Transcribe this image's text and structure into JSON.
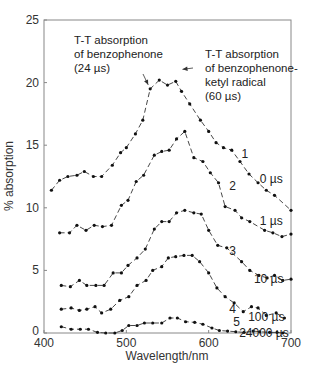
{
  "chart_data": {
    "type": "line",
    "title": "",
    "xlabel": "Wavelength/nm",
    "ylabel": "% absorption",
    "xlim": [
      400,
      700
    ],
    "ylim": [
      0,
      25
    ],
    "xticks": [
      400,
      500,
      600,
      700
    ],
    "yticks": [
      0,
      5,
      10,
      15,
      20,
      25
    ],
    "grid": false,
    "legend": "none (inline series labels)",
    "series": [
      {
        "name": "1",
        "time_label": "0 µs",
        "x": [
          409,
          419,
          429,
          440,
          449,
          460,
          470,
          483,
          493,
          500,
          511,
          520,
          529,
          540,
          550,
          560,
          567,
          577,
          590,
          600,
          609,
          618,
          628,
          638,
          649,
          660,
          670,
          680,
          700
        ],
        "y": [
          11.4,
          12.2,
          12.5,
          12.6,
          12.9,
          12.5,
          12.5,
          13.4,
          14.4,
          14.8,
          15.9,
          17.0,
          19.5,
          20.2,
          19.8,
          20.1,
          19.3,
          18.3,
          17.0,
          16.1,
          15.2,
          14.8,
          14.6,
          13.7,
          12.7,
          12.0,
          11.4,
          11.0,
          9.8
        ]
      },
      {
        "name": "2",
        "time_label": "1 µs",
        "x": [
          419,
          431,
          440,
          451,
          461,
          471,
          482,
          494,
          502,
          512,
          521,
          534,
          543,
          552,
          561,
          571,
          582,
          593,
          602,
          612,
          620,
          632,
          640,
          650,
          668,
          678,
          689,
          700
        ],
        "y": [
          8.0,
          8.0,
          8.6,
          8.2,
          8.6,
          8.5,
          8.6,
          10.2,
          10.6,
          12.1,
          12.6,
          14.2,
          14.5,
          14.6,
          15.5,
          16.1,
          14.0,
          13.7,
          12.8,
          12.0,
          10.1,
          9.8,
          9.2,
          8.9,
          8.2,
          8.0,
          7.7,
          7.9
        ]
      },
      {
        "name": "3",
        "time_label": "10 µs",
        "x": [
          421,
          432,
          443,
          452,
          463,
          473,
          484,
          494,
          502,
          513,
          523,
          534,
          543,
          552,
          561,
          571,
          582,
          591,
          600,
          611,
          622,
          640,
          650,
          661,
          671,
          680,
          690,
          700
        ],
        "y": [
          3.8,
          3.7,
          4.2,
          3.8,
          3.8,
          3.8,
          4.8,
          4.8,
          5.4,
          6.0,
          6.7,
          8.3,
          8.9,
          8.9,
          9.6,
          9.8,
          9.6,
          9.5,
          8.2,
          7.0,
          6.8,
          5.7,
          5.0,
          4.6,
          4.4,
          4.6,
          4.2,
          4.3
        ]
      },
      {
        "name": "4",
        "time_label": "100 µs",
        "x": [
          421,
          433,
          443,
          452,
          462,
          470,
          481,
          492,
          503,
          513,
          524,
          532,
          543,
          551,
          560,
          570,
          580,
          589,
          600,
          610,
          620,
          631,
          642,
          652,
          660,
          670,
          682,
          692
        ],
        "y": [
          1.9,
          2.0,
          1.8,
          1.9,
          2.1,
          1.6,
          1.9,
          2.6,
          2.9,
          3.8,
          4.2,
          5.0,
          5.3,
          6.0,
          6.1,
          6.2,
          6.2,
          5.7,
          4.8,
          3.6,
          2.9,
          2.4,
          1.7,
          2.1,
          2.0,
          1.4,
          1.6,
          1.2
        ]
      },
      {
        "name": "5",
        "time_label": "24000 µs",
        "x": [
          421,
          433,
          444,
          454,
          465,
          475,
          486,
          495,
          503,
          513,
          522,
          532,
          543,
          553,
          562,
          572,
          583,
          593,
          604,
          613,
          623,
          633,
          643,
          654,
          662,
          674,
          683,
          690
        ],
        "y": [
          0.5,
          0.3,
          0.3,
          0.3,
          0.05,
          0.0,
          0.0,
          0.2,
          0.6,
          0.6,
          0.8,
          0.8,
          0.8,
          1.2,
          1.2,
          0.9,
          0.85,
          0.7,
          0.4,
          0.2,
          0.15,
          0.1,
          0.05,
          0.15,
          0.1,
          0.05,
          0.05,
          0.0
        ]
      }
    ],
    "annotations": [
      {
        "lines": [
          "T-T absorption",
          "of benzophenone",
          "(24 µs)"
        ],
        "arrow_to": [
          529,
          19.5
        ]
      },
      {
        "lines": [
          "T-T absorption",
          "of benzophenone-",
          "ketyl radical",
          "(60 µs)"
        ],
        "arrow_to": [
          567,
          19.3
        ]
      }
    ]
  },
  "labels": {
    "xlabel": "Wavelength/nm",
    "ylabel": "% absorption"
  }
}
